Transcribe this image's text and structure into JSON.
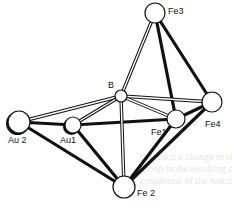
{
  "figure": {
    "type": "cluster-structure",
    "atoms": [
      {
        "id": "Fe3",
        "label": "Fe3",
        "x": 155,
        "y": 13,
        "r": 10,
        "lx": 168,
        "ly": 14
      },
      {
        "id": "B",
        "label": "B",
        "x": 121,
        "y": 96,
        "r": 6,
        "lx": 108,
        "ly": 88
      },
      {
        "id": "Au2",
        "label": "Au 2",
        "x": 19,
        "y": 122,
        "r": 11,
        "lx": 8,
        "ly": 143
      },
      {
        "id": "Au1",
        "label": "Au1",
        "x": 73,
        "y": 125,
        "r": 8,
        "lx": 60,
        "ly": 143
      },
      {
        "id": "Fe1",
        "label": "Fe1",
        "x": 176,
        "y": 119,
        "r": 9,
        "lx": 151,
        "ly": 135
      },
      {
        "id": "Fe4",
        "label": "Fe4",
        "x": 212,
        "y": 102,
        "r": 10,
        "lx": 205,
        "ly": 127
      },
      {
        "id": "Fe2",
        "label": "Fe 2",
        "x": 124,
        "y": 187,
        "r": 11,
        "lx": 137,
        "ly": 196
      }
    ],
    "bonds_double": [
      [
        "B",
        "Fe3"
      ],
      [
        "B",
        "Au2"
      ],
      [
        "B",
        "Au1"
      ],
      [
        "B",
        "Fe1"
      ],
      [
        "B",
        "Fe4"
      ],
      [
        "B",
        "Fe2"
      ]
    ],
    "bonds_bold": [
      [
        "Fe3",
        "Fe1"
      ],
      [
        "Fe3",
        "Fe4"
      ],
      [
        "Au2",
        "Au1"
      ],
      [
        "Au1",
        "Fe1"
      ],
      [
        "Au2",
        "Fe2"
      ],
      [
        "Au1",
        "Fe2"
      ],
      [
        "Fe1",
        "Fe4"
      ],
      [
        "Fe1",
        "Fe2"
      ],
      [
        "Fe4",
        "Fe2"
      ]
    ]
  },
  "labels": {
    "fe3": "Fe3",
    "b": "B",
    "au2": "Au 2",
    "au1": "Au1",
    "fe1": "Fe1",
    "fe4": "Fe4",
    "fe2": "Fe 2"
  },
  "background_text_fragments": [
    "that such a change in structure upon the",
    "group in the resulting clusters with the",
    "conditions of the reaction"
  ]
}
